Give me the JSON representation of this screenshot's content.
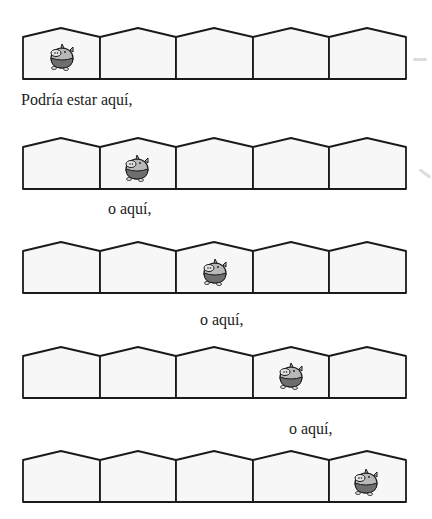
{
  "illustration": {
    "house_count_per_row": 5,
    "rows": [
      {
        "pig_position": 1,
        "caption": "Podría estar aquí,"
      },
      {
        "pig_position": 2,
        "caption": "o aquí,"
      },
      {
        "pig_position": 3,
        "caption": "o aquí,"
      },
      {
        "pig_position": 4,
        "caption": "o aquí,"
      },
      {
        "pig_position": 5,
        "caption": ""
      }
    ]
  },
  "colors": {
    "outline": "#1a1a1a",
    "house_fill": "#f7f7f7",
    "pig_light": "#b8b8b8",
    "pig_dark": "#6e6e6e"
  }
}
